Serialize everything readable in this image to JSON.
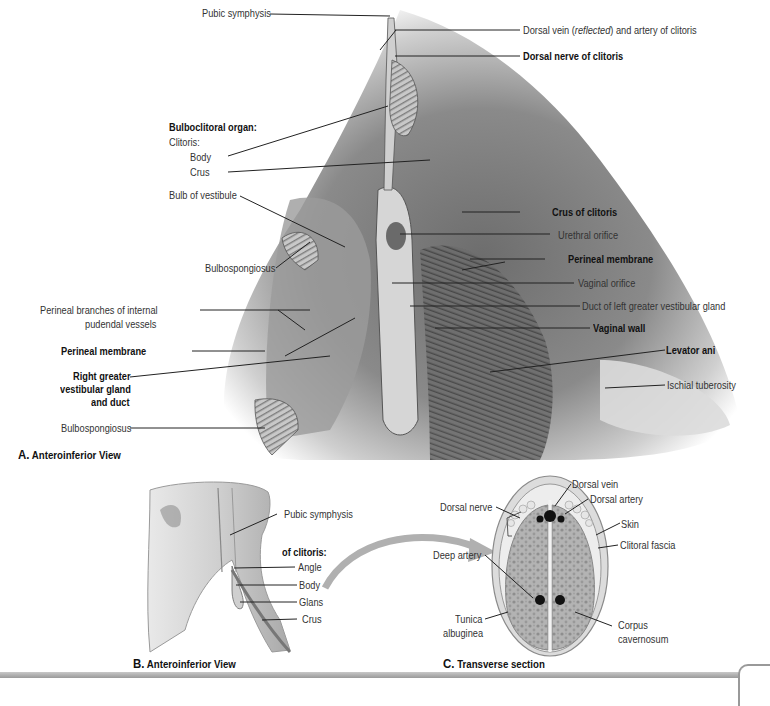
{
  "figure_a": {
    "caption_letter": "A.",
    "caption_text": "Anteroinferior View",
    "labels": {
      "pubic_symphysis": "Pubic symphysis",
      "dorsal_vein_prefix": "Dorsal vein (",
      "dorsal_vein_italic": "reflected",
      "dorsal_vein_suffix": ") and artery of clitoris",
      "dorsal_nerve": "Dorsal nerve of clitoris",
      "bulboclitoral_organ": "Bulboclitoral organ:",
      "clitoris": "Clitoris:",
      "body": "Body",
      "crus": "Crus",
      "bulb_of_vestibule": "Bulb of vestibule",
      "crus_of_clitoris": "Crus of clitoris",
      "urethral_orifice": "Urethral orifice",
      "bulbospongiosus_upper": "Bulbospongiosus",
      "perineal_membrane_right": "Perineal membrane",
      "vaginal_orifice": "Vaginal orifice",
      "perineal_branches_1": "Perineal branches of internal",
      "perineal_branches_2": "pudendal vessels",
      "duct_left_gland": "Duct of left greater vestibular gland",
      "vaginal_wall": "Vaginal wall",
      "perineal_membrane_left": "Perineal membrane",
      "levator_ani": "Levator ani",
      "right_gland_1": "Right greater",
      "right_gland_2": "vestibular gland",
      "right_gland_3": "and duct",
      "ischial_tuberosity": "Ischial tuberosity",
      "bulbospongiosus_lower": "Bulbospongiosus"
    }
  },
  "figure_b": {
    "caption_letter": "B.",
    "caption_text": "Anteroinferior View",
    "labels": {
      "pubic_symphysis": "Pubic symphysis",
      "of_clitoris": "of clitoris:",
      "angle": "Angle",
      "body": "Body",
      "glans": "Glans",
      "crus": "Crus"
    }
  },
  "figure_c": {
    "caption_letter": "C.",
    "caption_text": "Transverse section",
    "labels": {
      "dorsal_vein": "Dorsal vein",
      "dorsal_artery": "Dorsal artery",
      "dorsal_nerve": "Dorsal nerve",
      "skin": "Skin",
      "clitoral_fascia": "Clitoral fascia",
      "deep_artery": "Deep artery",
      "tunica_1": "Tunica",
      "tunica_2": "albuginea",
      "corpus_1": "Corpus",
      "corpus_2": "cavernosum"
    }
  }
}
